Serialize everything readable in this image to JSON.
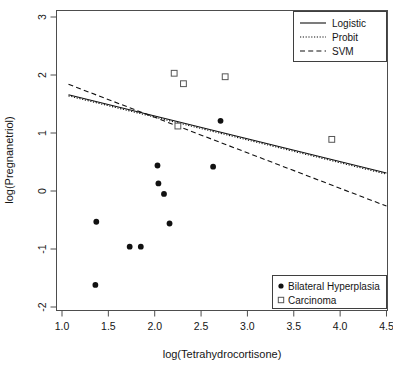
{
  "chart_data": {
    "type": "scatter",
    "title": "",
    "xlabel": "log(Tetrahydrocortisone)",
    "ylabel": "log(Pregnanetriol)",
    "xlim": [
      0.93,
      4.58
    ],
    "ylim": [
      -2.18,
      3.12
    ],
    "xticks": [
      "1.0",
      "1.5",
      "2.0",
      "2.5",
      "3.0",
      "3.5",
      "4.0",
      "4.5"
    ],
    "xtick_values": [
      1.0,
      1.5,
      2.0,
      2.5,
      3.0,
      3.5,
      4.0,
      4.5
    ],
    "yticks": [
      "3",
      "2",
      "1",
      "0",
      "-1",
      "-2"
    ],
    "ytick_values": [
      3,
      2,
      1,
      0,
      -1,
      -2
    ],
    "grid": false,
    "legend_position": [
      "top-right",
      "bottom-right"
    ],
    "series": [
      {
        "name": "Bilateral Hyperplasia",
        "marker": "filled-circle",
        "color": "#111111",
        "points": [
          {
            "x": 1.37,
            "y": -0.53
          },
          {
            "x": 1.36,
            "y": -1.62
          },
          {
            "x": 1.73,
            "y": -0.96
          },
          {
            "x": 1.85,
            "y": -0.96
          },
          {
            "x": 2.03,
            "y": 0.44
          },
          {
            "x": 2.04,
            "y": 0.13
          },
          {
            "x": 2.1,
            "y": -0.05
          },
          {
            "x": 2.16,
            "y": -0.56
          },
          {
            "x": 2.63,
            "y": 0.42
          },
          {
            "x": 2.71,
            "y": 1.21
          }
        ]
      },
      {
        "name": "Carcinoma",
        "marker": "open-square",
        "color": "#555555",
        "points": [
          {
            "x": 2.21,
            "y": 2.03
          },
          {
            "x": 2.31,
            "y": 1.85
          },
          {
            "x": 2.76,
            "y": 1.97
          },
          {
            "x": 2.25,
            "y": 1.12
          },
          {
            "x": 3.91,
            "y": 0.89
          }
        ]
      }
    ],
    "fit_lines": [
      {
        "name": "Logistic",
        "style": "solid",
        "color": "#111111",
        "x": [
          1.07,
          4.5
        ],
        "y": [
          1.66,
          0.31
        ]
      },
      {
        "name": "Probit",
        "style": "dotted",
        "color": "#111111",
        "x": [
          1.07,
          4.5
        ],
        "y": [
          1.64,
          0.29
        ]
      },
      {
        "name": "SVM",
        "style": "dashed",
        "color": "#111111",
        "x": [
          1.07,
          4.5
        ],
        "y": [
          1.84,
          -0.26
        ]
      }
    ]
  },
  "legend_top": {
    "entries": [
      {
        "label": "Logistic",
        "style": "solid"
      },
      {
        "label": "Probit",
        "style": "dotted"
      },
      {
        "label": "SVM",
        "style": "dashed"
      }
    ]
  },
  "legend_bottom": {
    "entries": [
      {
        "label": "Bilateral Hyperplasia",
        "marker": "filled-circle"
      },
      {
        "label": "Carcinoma",
        "marker": "open-square"
      }
    ]
  },
  "axes": {
    "x_title": "log(Tetrahydrocortisone)",
    "y_title": "log(Pregnanetriol)"
  }
}
